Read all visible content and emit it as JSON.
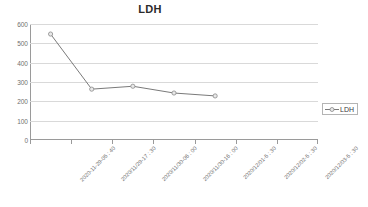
{
  "chart_data": {
    "type": "line",
    "title": "LDH",
    "xlabel": "",
    "ylabel": "",
    "ylim": [
      0,
      600
    ],
    "ytick_step": 100,
    "yticks": [
      600,
      500,
      400,
      300,
      200,
      100,
      0
    ],
    "grid": true,
    "legend_position": "right",
    "categories": [
      "2020-11-29-05 : 40",
      "2020/11/29-17 : 30",
      "2020/11/30-06 : 00",
      "2020/11/30-16 : 00",
      "2020/12/01-5 : 30",
      "2020/12/02-5 : 30",
      "2020/12/03-5 : 30"
    ],
    "series": [
      {
        "name": "LDH",
        "values": [
          548,
          263,
          278,
          243,
          228,
          null,
          null
        ],
        "color": "#7a7a7a",
        "marker": "circle",
        "marker_fill": "#e8e8e8",
        "marker_edge": "#8a8a8a"
      }
    ]
  },
  "legend": {
    "entries": [
      {
        "label": "LDH"
      }
    ]
  },
  "axis": {
    "line_color": "#9a9a9a",
    "grid_color": "#d9d9d9",
    "tick_label_color": "#6f6f6f"
  }
}
